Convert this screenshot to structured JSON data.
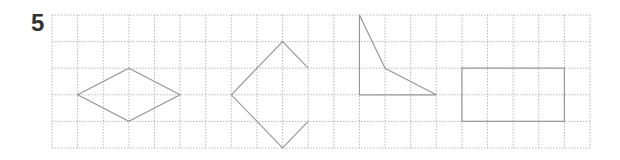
{
  "problem_number": "5",
  "grid": {
    "origin_x": 52,
    "origin_y": 15,
    "cell_w": 25.62,
    "cell_h": 26.6,
    "columns": 21,
    "rows": 5,
    "line_color": "#aaaaaa"
  },
  "shapes": [
    {
      "name": "rhombus",
      "closed": true,
      "points": [
        [
          1,
          3
        ],
        [
          3,
          2
        ],
        [
          5,
          3
        ],
        [
          3,
          4
        ]
      ]
    },
    {
      "name": "open-diamond",
      "closed": false,
      "points": [
        [
          10,
          2
        ],
        [
          9,
          1
        ],
        [
          7,
          3
        ],
        [
          9,
          5
        ],
        [
          10,
          4
        ]
      ]
    },
    {
      "name": "quadrilateral",
      "closed": true,
      "points": [
        [
          12,
          0
        ],
        [
          12,
          3
        ],
        [
          15,
          3
        ],
        [
          13,
          2
        ]
      ]
    },
    {
      "name": "rectangle",
      "closed": true,
      "points": [
        [
          16,
          2
        ],
        [
          20,
          2
        ],
        [
          20,
          4
        ],
        [
          16,
          4
        ]
      ]
    }
  ],
  "shape_color": "#999999"
}
